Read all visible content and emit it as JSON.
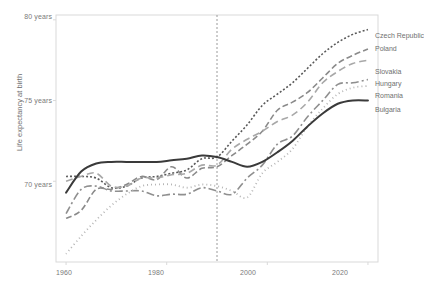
{
  "chart_data": {
    "type": "line",
    "title": "",
    "xlabel": "",
    "ylabel": "Life expectancy at birth",
    "xlim": [
      1958,
      2022
    ],
    "ylim": [
      65.0,
      80.3
    ],
    "grid": false,
    "legend_position": "right-inline-labels",
    "xticks": [
      1960,
      1980,
      2000,
      2020
    ],
    "xtick_labels": [
      "1960",
      "1980",
      "2000",
      "2020"
    ],
    "yticks": [
      70,
      75,
      80
    ],
    "ytick_labels": [
      "70 years",
      "75 years",
      "80 years"
    ],
    "annotations": [
      {
        "type": "vertical-dashed-line",
        "x": 1990,
        "label": ""
      }
    ],
    "series": [
      {
        "name": "Czech Republic",
        "color": "#595959",
        "dash": "2,2",
        "width": 1.6,
        "label_x": 2021,
        "label_y": 79.0,
        "x": [
          1960,
          1963,
          1966,
          1969,
          1972,
          1975,
          1978,
          1981,
          1984,
          1987,
          1990,
          1993,
          1996,
          1999,
          2002,
          2005,
          2008,
          2011,
          2014,
          2017,
          2020
        ],
        "values": [
          70.3,
          70.3,
          70.2,
          69.6,
          69.7,
          70.2,
          70.3,
          70.5,
          70.7,
          71.4,
          71.5,
          72.5,
          73.5,
          74.7,
          75.4,
          76.1,
          77.0,
          77.9,
          78.6,
          79.1,
          79.4
        ]
      },
      {
        "name": "Poland",
        "color": "#8a8a8a",
        "dash": "6,3",
        "width": 1.6,
        "label_x": 2021,
        "label_y": 78.2,
        "x": [
          1960,
          1963,
          1966,
          1969,
          1972,
          1975,
          1978,
          1981,
          1984,
          1987,
          1990,
          1993,
          1996,
          1999,
          2002,
          2005,
          2008,
          2011,
          2014,
          2017,
          2020
        ],
        "values": [
          67.7,
          68.2,
          69.5,
          69.5,
          69.8,
          70.3,
          70.1,
          70.9,
          70.2,
          70.8,
          70.9,
          71.6,
          72.3,
          73.1,
          74.4,
          74.9,
          75.5,
          76.4,
          77.3,
          77.8,
          78.2
        ]
      },
      {
        "name": "Slovakia",
        "color": "#a8a8a8",
        "dash": "7,4",
        "width": 1.6,
        "label_x": 2021,
        "label_y": 76.8,
        "x": [
          1960,
          1963,
          1966,
          1969,
          1972,
          1975,
          1978,
          1981,
          1984,
          1987,
          1990,
          1993,
          1996,
          1999,
          2002,
          2005,
          2008,
          2011,
          2014,
          2017,
          2020
        ],
        "values": [
          70.0,
          70.3,
          70.5,
          69.7,
          69.7,
          70.2,
          70.2,
          70.4,
          70.5,
          71.0,
          71.0,
          72.0,
          72.6,
          73.1,
          73.7,
          74.1,
          74.9,
          76.1,
          76.8,
          77.3,
          77.5
        ]
      },
      {
        "name": "Hungary",
        "color": "#8f8f8f",
        "dash": "8,3,2,3",
        "width": 1.6,
        "label_x": 2021,
        "label_y": 76.0,
        "x": [
          1960,
          1963,
          1966,
          1969,
          1972,
          1975,
          1978,
          1981,
          1984,
          1987,
          1990,
          1993,
          1996,
          1999,
          2002,
          2005,
          2008,
          2011,
          2014,
          2017,
          2020
        ],
        "values": [
          68.0,
          69.5,
          69.7,
          69.4,
          69.4,
          69.4,
          69.1,
          69.2,
          69.2,
          69.6,
          69.4,
          69.2,
          70.2,
          71.0,
          72.3,
          72.8,
          74.0,
          75.0,
          76.0,
          76.1,
          76.3
        ]
      },
      {
        "name": "Romania",
        "color": "#b5b5b5",
        "dash": "1,3",
        "width": 1.8,
        "label_x": 2021,
        "label_y": 75.3,
        "x": [
          1960,
          1963,
          1966,
          1969,
          1972,
          1975,
          1978,
          1981,
          1984,
          1987,
          1990,
          1993,
          1996,
          1999,
          2002,
          2005,
          2008,
          2011,
          2014,
          2017,
          2020
        ],
        "values": [
          65.5,
          66.6,
          67.6,
          68.5,
          69.2,
          69.7,
          69.8,
          69.8,
          69.6,
          69.8,
          69.7,
          69.4,
          69.0,
          70.5,
          71.2,
          72.0,
          73.4,
          74.5,
          75.4,
          75.8,
          75.9
        ]
      },
      {
        "name": "Bulgaria",
        "color": "#3a3a3a",
        "dash": "none",
        "width": 2.0,
        "label_x": 2021,
        "label_y": 74.4,
        "x": [
          1960,
          1963,
          1966,
          1969,
          1972,
          1975,
          1978,
          1981,
          1984,
          1987,
          1990,
          1993,
          1996,
          1999,
          2002,
          2005,
          2008,
          2011,
          2014,
          2017,
          2020
        ],
        "values": [
          69.3,
          70.6,
          71.1,
          71.2,
          71.2,
          71.2,
          71.2,
          71.3,
          71.4,
          71.6,
          71.5,
          71.2,
          70.9,
          71.2,
          71.8,
          72.5,
          73.4,
          74.2,
          74.8,
          75.0,
          75.0
        ]
      }
    ]
  },
  "axes": {
    "ylabel_title": "Life expectancy at birth",
    "ytick_labels": [
      "80 years",
      "75 years",
      "70 years"
    ],
    "xtick_labels": [
      "1960",
      "1980",
      "2000",
      "2020"
    ]
  },
  "colors": {
    "background": "#ffffff",
    "frame": "#d9d9d9",
    "text": "#6f6f6f",
    "reference_line": "#9a9a9a"
  }
}
